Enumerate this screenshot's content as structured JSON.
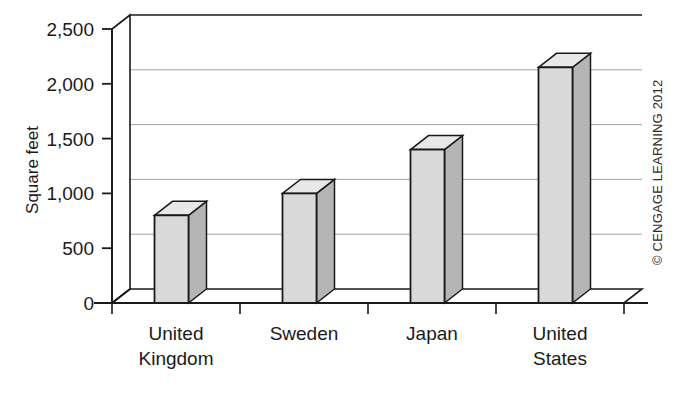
{
  "chart_data": {
    "type": "bar",
    "title": "",
    "subtitle": "",
    "xlabel": "",
    "ylabel": "Square feet",
    "categories": [
      "United Kingdom",
      "Sweden",
      "Japan",
      "United States"
    ],
    "category_lines": [
      [
        "United",
        "Kingdom"
      ],
      [
        "Sweden"
      ],
      [
        "Japan"
      ],
      [
        "United",
        "States"
      ]
    ],
    "values": [
      800,
      1000,
      1400,
      2150
    ],
    "ylim": [
      0,
      2500
    ],
    "ytick_values": [
      0,
      500,
      1000,
      1500,
      2000,
      2500
    ],
    "ytick_labels": [
      "0",
      "500",
      "1,000",
      "1,500",
      "2,000",
      "2,500"
    ],
    "grid": true,
    "grid_axis": "y",
    "legend": false,
    "legend_position": "none",
    "style": "3d-column",
    "bar_face_color": "#d9d9d9",
    "bar_side_color": "#b5b5b5",
    "bar_top_color": "#e8e8e8",
    "bar_edge_color": "#1a1a1a",
    "grid_color": "#9a9a9a",
    "axis_color": "#1a1a1a",
    "background_color": "#ffffff"
  },
  "credit": {
    "text": "© CENGAGE LEARNING 2012",
    "orientation": "vertical"
  },
  "axes": {
    "y_axis_name": "Square feet",
    "x_axis_name": ""
  }
}
